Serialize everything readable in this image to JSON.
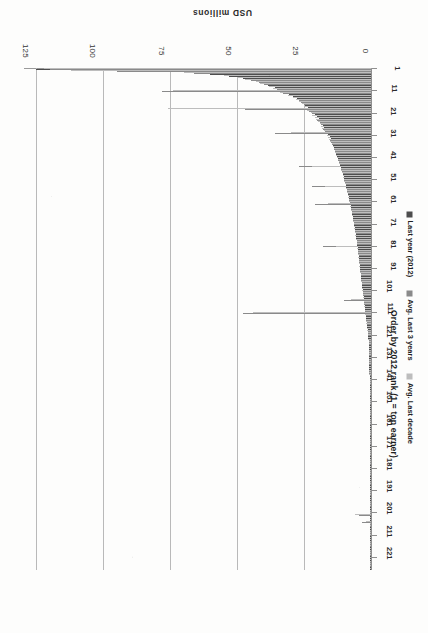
{
  "chart_data": {
    "type": "bar",
    "orientation": "horizontal",
    "title": "",
    "xlabel": "Order by 2012 rank (1 = top earner)",
    "ylabel": "USD millions",
    "value_axis_ticks": [
      0,
      25,
      50,
      75,
      100,
      125
    ],
    "value_axis_lim": [
      0,
      130
    ],
    "category_axis_ticks": [
      1,
      11,
      21,
      31,
      41,
      51,
      61,
      71,
      81,
      91,
      101,
      111,
      121,
      131,
      141,
      151,
      161,
      171,
      181,
      191,
      201,
      211,
      221
    ],
    "category_axis_lim": [
      1,
      226
    ],
    "grid": "vertical-gridlines-at-value-ticks",
    "legend_position": "bottom-right",
    "colors": {
      "series_1": "#4d4d4d",
      "series_2": "#8a8a8a",
      "series_3": "#bdbdbd",
      "gridline": "#b9b9b9",
      "axis": "#8f8f8f",
      "text": "#1f1f1f",
      "background": "#fdfdfc"
    },
    "series": [
      {
        "name": "Last year (2012)",
        "color": "#4d4d4d",
        "values": [
          125.0,
          78.0,
          60.0,
          53.0,
          48.0,
          44.0,
          41.0,
          38.5,
          36.0,
          34.0,
          32.0,
          30.5,
          29.0,
          27.5,
          26.5,
          25.5,
          24.5,
          23.5,
          22.5,
          22.0,
          21.0,
          20.0,
          19.5,
          19.0,
          18.5,
          18.0,
          17.5,
          17.0,
          16.5,
          16.0,
          15.5,
          15.0,
          14.8,
          14.5,
          14.2,
          13.8,
          13.5,
          13.2,
          12.9,
          12.6,
          12.3,
          12.0,
          11.8,
          11.5,
          11.2,
          11.0,
          10.8,
          10.5,
          10.2,
          10.0,
          9.8,
          9.6,
          9.4,
          9.2,
          9.0,
          8.8,
          8.6,
          8.4,
          8.2,
          8.0,
          7.8,
          7.6,
          7.5,
          7.3,
          7.1,
          7.0,
          6.8,
          6.7,
          6.5,
          6.4,
          6.2,
          6.1,
          6.0,
          5.8,
          5.7,
          5.6,
          5.5,
          5.3,
          5.2,
          5.1,
          5.0,
          4.9,
          4.8,
          4.7,
          4.6,
          4.5,
          4.4,
          4.3,
          4.2,
          4.1,
          4.0,
          3.9,
          3.8,
          3.7,
          3.6,
          3.5,
          3.4,
          3.3,
          3.2,
          3.1,
          3.0,
          2.9,
          2.8,
          2.7,
          2.6,
          2.5,
          2.4,
          2.3,
          2.2,
          2.1,
          2.0,
          1.9,
          1.8,
          1.7,
          1.6,
          1.5,
          1.4,
          1.3,
          1.2,
          1.1,
          1.0,
          0.95,
          0.9,
          0.88,
          0.85,
          0.82,
          0.8,
          0.78,
          0.75,
          0.72,
          0.7,
          0.68,
          0.66,
          0.64,
          0.62,
          0.6,
          0.58,
          0.56,
          0.55,
          0.53,
          0.52,
          0.5,
          0.49,
          0.48,
          0.47,
          0.46,
          0.45,
          0.44,
          0.43,
          0.42,
          0.41,
          0.4,
          0.39,
          0.38,
          0.37,
          0.36,
          0.35,
          0.34,
          0.33,
          0.32,
          0.31,
          0.3,
          0.3,
          0.29,
          0.28,
          0.28,
          0.27,
          0.26,
          0.26,
          0.25,
          0.25,
          0.24,
          0.24,
          0.23,
          0.23,
          0.22,
          0.22,
          0.21,
          0.21,
          0.2,
          0.2,
          0.19,
          0.19,
          0.18,
          0.18,
          0.17,
          0.17,
          0.16,
          0.16,
          0.15,
          0.15,
          0.14,
          0.14,
          0.13,
          0.13,
          0.12,
          0.12,
          0.11,
          0.11,
          0.1,
          0.1,
          0.09,
          0.09,
          0.08,
          0.08,
          0.07,
          0.07,
          0.06,
          0.06,
          0.05,
          0.05,
          0.05,
          0.04,
          0.04,
          0.04,
          0.03,
          0.03,
          0.03,
          0.02,
          0.02,
          0.02,
          0.02,
          0.01,
          0.01,
          0.01,
          0.01
        ]
      },
      {
        "name": "Avg. Last 3 years",
        "color": "#8a8a8a",
        "values": [
          120.0,
          95.0,
          66.0,
          50.0,
          46.0,
          45.0,
          42.0,
          40.0,
          37.0,
          35.0,
          78.0,
          33.0,
          30.0,
          28.0,
          27.0,
          26.0,
          25.0,
          24.0,
          47.0,
          23.0,
          22.0,
          21.5,
          20.5,
          20.0,
          19.2,
          18.8,
          18.2,
          17.8,
          17.2,
          36.0,
          16.2,
          15.8,
          15.2,
          14.9,
          14.4,
          14.0,
          13.7,
          13.4,
          13.0,
          12.8,
          12.5,
          12.2,
          11.9,
          11.6,
          27.0,
          11.1,
          10.9,
          10.6,
          10.4,
          10.1,
          9.9,
          9.7,
          9.5,
          22.0,
          9.1,
          8.9,
          8.7,
          8.5,
          8.3,
          8.1,
          7.9,
          21.0,
          7.6,
          7.4,
          7.2,
          7.05,
          6.9,
          6.75,
          6.6,
          6.45,
          6.3,
          6.15,
          6.05,
          5.9,
          5.75,
          5.65,
          5.55,
          5.4,
          5.25,
          5.15,
          18.0,
          4.95,
          4.85,
          4.75,
          4.65,
          4.55,
          4.45,
          4.35,
          4.25,
          4.15,
          4.05,
          3.95,
          3.85,
          3.75,
          3.65,
          3.55,
          3.45,
          3.35,
          3.25,
          3.15,
          3.05,
          2.95,
          2.85,
          2.75,
          10.0,
          2.55,
          2.45,
          2.35,
          2.25,
          2.15,
          48.0,
          1.95,
          1.85,
          1.75,
          1.65,
          1.55,
          1.45,
          1.35,
          1.25,
          1.15,
          1.05,
          0.97,
          0.92,
          0.89,
          0.86,
          0.83,
          0.81,
          0.79,
          0.76,
          0.73,
          0.71,
          0.69,
          0.67,
          0.65,
          0.63,
          0.61,
          0.59,
          0.57,
          0.56,
          0.54,
          0.53,
          0.51,
          0.5,
          0.49,
          0.48,
          0.47,
          0.46,
          0.45,
          0.44,
          0.43,
          0.42,
          0.41,
          0.4,
          0.39,
          0.38,
          0.37,
          0.36,
          0.35,
          0.34,
          0.33,
          0.32,
          0.31,
          0.31,
          0.3,
          0.29,
          0.29,
          0.28,
          0.27,
          0.27,
          0.26,
          0.26,
          0.25,
          0.25,
          0.24,
          0.24,
          0.23,
          0.23,
          0.22,
          0.22,
          0.21,
          0.21,
          0.2,
          0.2,
          0.19,
          0.19,
          0.18,
          0.18,
          0.17,
          0.17,
          0.16,
          0.16,
          0.15,
          0.15,
          0.14,
          0.14,
          0.13,
          0.13,
          0.12,
          0.12,
          0.11,
          0.11,
          4.5,
          0.1,
          0.09,
          3.2,
          0.08,
          0.08,
          0.07,
          0.07,
          0.06,
          0.06,
          0.06,
          0.05,
          0.05,
          0.05,
          0.04,
          0.04,
          0.04,
          0.03,
          0.03,
          0.03,
          0.03,
          0.02,
          0.02,
          0.02,
          0.02
        ]
      },
      {
        "name": "Avg. Last decade",
        "color": "#bdbdbd",
        "values": [
          122.0,
          112.0,
          70.0,
          55.0,
          50.0,
          47.0,
          43.0,
          41.5,
          38.0,
          36.5,
          74.0,
          34.0,
          31.0,
          29.0,
          28.0,
          27.0,
          25.8,
          24.8,
          76.0,
          23.8,
          22.5,
          22.0,
          21.0,
          20.5,
          19.8,
          19.2,
          18.6,
          18.2,
          17.6,
          30.0,
          16.6,
          16.2,
          15.6,
          15.2,
          14.7,
          14.3,
          14.0,
          13.6,
          13.3,
          13.0,
          12.7,
          12.4,
          12.1,
          11.8,
          22.0,
          11.3,
          11.1,
          10.8,
          10.6,
          10.3,
          10.1,
          9.9,
          9.7,
          17.0,
          9.3,
          9.1,
          8.9,
          8.7,
          8.5,
          8.3,
          8.1,
          16.0,
          7.8,
          7.6,
          7.4,
          7.2,
          7.05,
          6.9,
          6.75,
          6.6,
          6.45,
          6.3,
          6.2,
          6.05,
          5.9,
          5.8,
          5.7,
          5.55,
          5.4,
          5.3,
          13.0,
          5.1,
          5.0,
          4.9,
          4.8,
          4.7,
          4.6,
          4.5,
          4.4,
          4.3,
          4.2,
          4.1,
          4.0,
          3.9,
          3.8,
          3.7,
          3.6,
          3.5,
          3.4,
          3.3,
          3.2,
          3.1,
          3.0,
          2.9,
          7.5,
          2.7,
          2.6,
          2.5,
          2.4,
          2.3,
          44.0,
          2.1,
          2.0,
          1.9,
          1.8,
          1.7,
          1.6,
          1.5,
          1.4,
          1.3,
          1.15,
          1.0,
          0.95,
          0.92,
          0.89,
          0.86,
          0.84,
          0.82,
          0.79,
          0.76,
          0.74,
          0.72,
          0.7,
          0.68,
          0.66,
          0.64,
          0.62,
          0.6,
          0.58,
          0.56,
          0.55,
          0.53,
          0.52,
          0.51,
          0.5,
          0.49,
          0.48,
          0.47,
          0.46,
          0.45,
          0.44,
          0.43,
          0.42,
          0.41,
          0.4,
          0.39,
          0.38,
          0.37,
          0.36,
          0.35,
          0.34,
          0.33,
          0.32,
          0.32,
          0.31,
          0.3,
          0.29,
          0.29,
          0.28,
          0.28,
          0.27,
          0.27,
          0.26,
          0.26,
          0.25,
          0.25,
          0.24,
          0.24,
          0.23,
          0.23,
          0.22,
          0.22,
          0.21,
          0.21,
          0.2,
          0.2,
          0.19,
          0.19,
          0.18,
          0.18,
          0.17,
          0.17,
          0.16,
          0.16,
          0.15,
          0.15,
          0.14,
          0.14,
          0.13,
          0.13,
          0.12,
          6.0,
          0.11,
          0.11,
          2.0,
          0.1,
          0.09,
          0.09,
          0.08,
          0.08,
          0.07,
          0.07,
          0.06,
          0.06,
          0.05,
          0.05,
          0.05,
          0.04,
          0.04,
          0.04,
          0.03,
          0.03,
          0.03,
          0.02,
          0.02,
          0.02
        ]
      }
    ]
  },
  "axes": {
    "value_axis_title": "USD millions",
    "category_axis_title": "Order by 2012 rank (1 = top earner)"
  },
  "legend": {
    "items": [
      {
        "label": "Last year (2012)",
        "color": "#4d4d4d"
      },
      {
        "label": "Avg. Last 3 years",
        "color": "#8a8a8a"
      },
      {
        "label": "Avg. Last decade",
        "color": "#bdbdbd"
      }
    ]
  }
}
